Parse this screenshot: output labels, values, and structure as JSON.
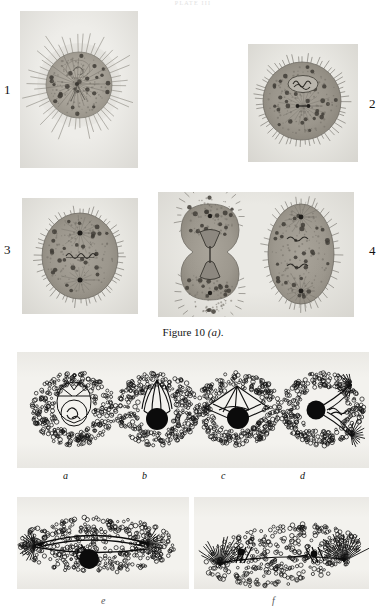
{
  "page": {
    "running_head": "PLATE III",
    "background_color": "#ffffff",
    "plate_tone": "#efeeea"
  },
  "caption": {
    "prefix": "Figure 10 ",
    "letter": "(a)",
    "suffix": "."
  },
  "micrographs": {
    "numerals": [
      {
        "label": "1",
        "side": "left"
      },
      {
        "label": "2",
        "side": "right"
      },
      {
        "label": "3",
        "side": "left"
      },
      {
        "label": "4",
        "side": "right"
      }
    ],
    "panels": [
      {
        "numeral": "1",
        "name": "panel-1",
        "description": "Spherical cell with long radiating spines, single central aster with radiating astral rays and a pale nucleus above centre; granular cytoplasm with dark granules.",
        "stage": "monaster",
        "spine_count": 46,
        "granule_count": 120
      },
      {
        "numeral": "2",
        "name": "panel-2",
        "description": "Spherical cell with short dense spines, oval chromosome plate in upper half and a small dark double centrosome at centre.",
        "stage": "chromosome plate",
        "spine_count": 54,
        "granule_count": 150
      },
      {
        "numeral": "3",
        "name": "panel-3",
        "description": "Ovoid cell with short spines, two dark spindle poles vertically arranged and an equatorial chromosome plate between them.",
        "stage": "metaphase spindle",
        "spine_count": 52,
        "granule_count": 150
      },
      {
        "numeral": "4",
        "name": "panel-4",
        "description": "Two adjacent dividing cells: left cell constricted into a dumb-bell with hour-glass mid-body, right cell elongate with two poles and two chromosome plates.",
        "stage": "cytokinesis / late anaphase",
        "spine_count": 90,
        "granule_count": 240
      }
    ]
  },
  "diagrams": {
    "row_one_labels": [
      "a",
      "b",
      "c",
      "d"
    ],
    "row_two_labels": [
      "e",
      "f"
    ],
    "panels": [
      {
        "label": "a",
        "name": "diagram-a",
        "description": "Stippled spherical cell; inner pear-shaped body enclosing a round nucleus containing coiled chromatin threads; faint segment lines radiating in the clear zone."
      },
      {
        "label": "b",
        "name": "diagram-b",
        "description": "Stippled spherical cell; tulip-shaped bundle of converging fibres above a solid black spherical body."
      },
      {
        "label": "c",
        "name": "diagram-c",
        "description": "Stippled cell with a broad tent-shaped fibre mass, internal chromosome threads, and a solid black sphere at its base."
      },
      {
        "label": "d",
        "name": "diagram-d",
        "description": "Stippled cell with a bipolar spindle running top-right to bottom-right, a black sphere at the left connected by fibres, and chromosome threads at the equator."
      },
      {
        "label": "e",
        "name": "diagram-e",
        "description": "Elongated stippled cell; a long horizontal spindle with asters at both ends, a looping fibre at centre and a solid black sphere below the axis."
      },
      {
        "label": "f",
        "name": "diagram-f",
        "description": "Crescent-shaped stippled cell; two dense asters with radiating fibres at the lower corners joined by a long horizontal axis with small dark bodies."
      }
    ]
  }
}
